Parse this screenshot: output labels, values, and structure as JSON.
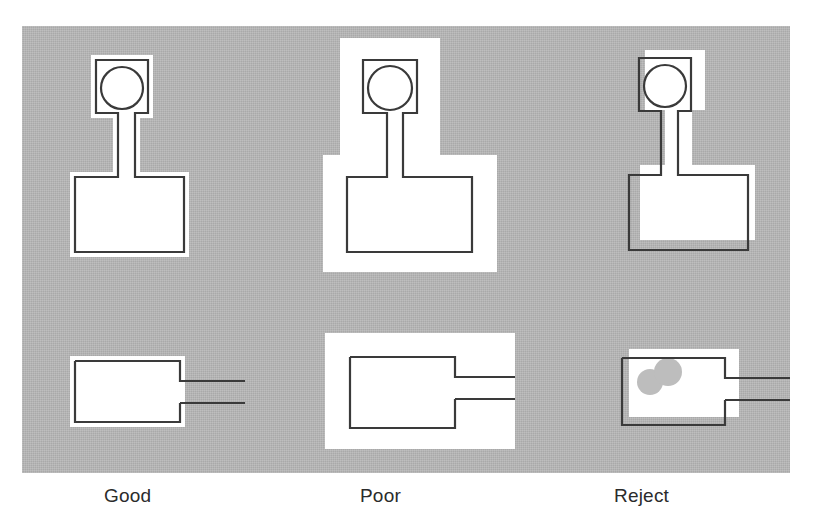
{
  "figure": {
    "panel": {
      "background_color": "#b8b8b8",
      "x": 22,
      "y": 26,
      "width": 768,
      "height": 447
    },
    "page_background_color": "#ffffff",
    "outline_color": "#3a3a3a",
    "coverage_color": "#ffffff",
    "void_color": "#bdbdbd"
  },
  "columns": [
    {
      "id": "good",
      "label": "Good",
      "label_x": 104,
      "verdict": "acceptable",
      "coverage_description": "thin uniform white fillet hugging the conductor outline on all sides",
      "halo_px": 5,
      "registration_offset": {
        "x": 0,
        "y": 0
      },
      "voids": 0
    },
    {
      "id": "poor",
      "label": "Poor",
      "label_x": 360,
      "verdict": "marginal",
      "coverage_description": "excessive white fillet spreading far beyond the conductor outline",
      "halo_px": 22,
      "registration_offset": {
        "x": 0,
        "y": 0
      },
      "voids": 0
    },
    {
      "id": "reject",
      "label": "Reject",
      "label_x": 614,
      "verdict": "rejectable",
      "coverage_description": "fillet misregistered off the conductor, outline exposed on two sides; voids present",
      "halo_px": 0,
      "registration_offset": {
        "x": 8,
        "y": -10
      },
      "voids": 2
    }
  ],
  "rows": [
    {
      "id": "row-top",
      "part": "round-pad-with-hole-and-trace-to-land",
      "description": "circular through-hole pad joined by a narrow neck to a rectangular land"
    },
    {
      "id": "row-bottom",
      "part": "rectangular-land-with-two-leads",
      "description": "rectangular land with two parallel leads exiting to the right"
    }
  ],
  "chart_data": {
    "type": "table",
    "columns": [
      "Grade",
      "Fillet halo (px)",
      "Registration offset (px)",
      "Voids"
    ],
    "rows": [
      [
        "Good",
        5,
        "0, 0",
        0
      ],
      [
        "Poor",
        22,
        "0, 0",
        0
      ],
      [
        "Reject",
        0,
        "8, -10",
        2
      ]
    ]
  }
}
